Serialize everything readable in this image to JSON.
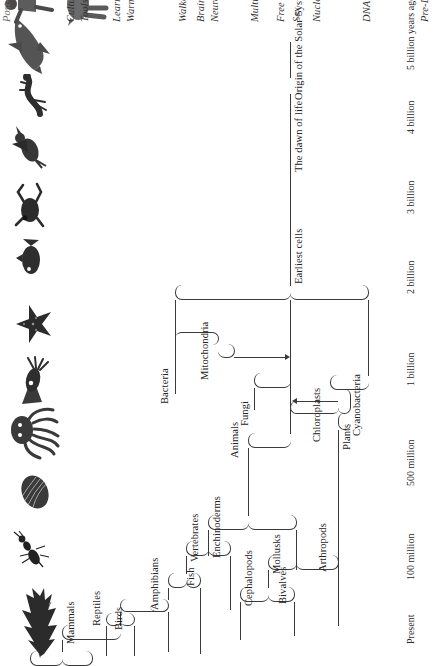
{
  "figure": {
    "title": "Post-DNA reproduction",
    "ink_color": "#3a3a3a",
    "paper_color": "#ffffff"
  },
  "time_axis": {
    "label_suffix": "years ago",
    "ticks": [
      {
        "id": "present",
        "label": "Present"
      },
      {
        "id": "100m",
        "label": "100 million"
      },
      {
        "id": "500m",
        "label": "500 million"
      },
      {
        "id": "1b",
        "label": "1 billion"
      },
      {
        "id": "2b",
        "label": "2 billion"
      },
      {
        "id": "3b",
        "label": "3 billion"
      },
      {
        "id": "4b",
        "label": "4 billion"
      },
      {
        "id": "5b",
        "label": "5 billion years ago"
      }
    ]
  },
  "clade_labels": [
    {
      "id": "mammals",
      "label": "Mammals"
    },
    {
      "id": "reptiles",
      "label": "Reptiles"
    },
    {
      "id": "birds",
      "label": "Birds"
    },
    {
      "id": "amphibians",
      "label": "Amphibians"
    },
    {
      "id": "fish",
      "label": "Fish"
    },
    {
      "id": "vertebrates",
      "label": "Vertebrates"
    },
    {
      "id": "echinoderms",
      "label": "Enchinoderms"
    },
    {
      "id": "cephalopods",
      "label": "Cephalopods"
    },
    {
      "id": "bivalves",
      "label": "Bivalves"
    },
    {
      "id": "mollusks",
      "label": "Mollusks"
    },
    {
      "id": "arthropods",
      "label": "Arthropods"
    },
    {
      "id": "plants",
      "label": "Plants"
    },
    {
      "id": "animals",
      "label": "Animals"
    },
    {
      "id": "fungi",
      "label": "Fungi"
    },
    {
      "id": "bacteria",
      "label": "Bacteria"
    },
    {
      "id": "mitochondria",
      "label": "Mitochondria"
    },
    {
      "id": "chloroplasts",
      "label": "Chloroplasts"
    },
    {
      "id": "cyanobacteria",
      "label": "Cyanobacteria"
    },
    {
      "id": "earliest_cells",
      "label": "Earliest cells"
    },
    {
      "id": "dawn_of_life",
      "label": "The dawn of life"
    },
    {
      "id": "origin_solar",
      "label": "Origin of the Solar System"
    }
  ],
  "milestones": [
    {
      "id": "culture",
      "label": "Culture"
    },
    {
      "id": "tools",
      "label": "Tools"
    },
    {
      "id": "learning",
      "label": "Learning"
    },
    {
      "id": "warm_blood",
      "label": "Warm blood"
    },
    {
      "id": "walkers",
      "label": "Walkers"
    },
    {
      "id": "brains",
      "label": "Brains"
    },
    {
      "id": "neurons",
      "label": "Neurons"
    },
    {
      "id": "multicelled",
      "label": "Multicelled animals"
    },
    {
      "id": "free_oxygen",
      "label": "Free oxygen"
    },
    {
      "id": "sex",
      "label": "Sex"
    },
    {
      "id": "nucleated_cells",
      "label": "Nucleated cells"
    },
    {
      "id": "dna",
      "label": "DNA"
    },
    {
      "id": "pre_dna",
      "label": "Pre-DNA reproduction"
    },
    {
      "id": "post_dna",
      "label": "Post-DNA reproduction"
    }
  ],
  "organisms": [
    {
      "id": "human",
      "name": "human-figure-illustration"
    },
    {
      "id": "horse",
      "name": "horse-illustration"
    },
    {
      "id": "dolphin",
      "name": "dolphin-illustration"
    },
    {
      "id": "lizard",
      "name": "lizard-illustration"
    },
    {
      "id": "bird",
      "name": "bird-illustration"
    },
    {
      "id": "frog",
      "name": "frog-illustration"
    },
    {
      "id": "fish",
      "name": "fish-illustration"
    },
    {
      "id": "starfish",
      "name": "starfish-illustration"
    },
    {
      "id": "squid",
      "name": "squid-illustration"
    },
    {
      "id": "octopus",
      "name": "octopus-illustration"
    },
    {
      "id": "clam",
      "name": "clam-shell-illustration"
    },
    {
      "id": "insect",
      "name": "insect-illustration"
    },
    {
      "id": "conifer",
      "name": "conifer-tree-illustration"
    }
  ]
}
